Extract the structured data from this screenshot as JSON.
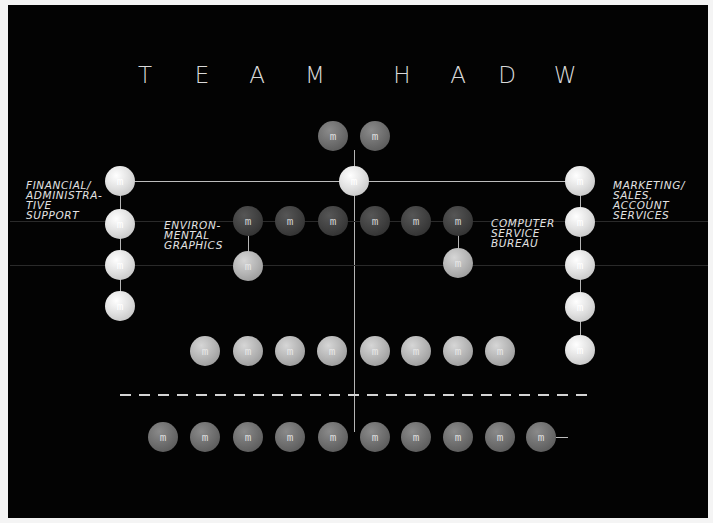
{
  "title": {
    "words": [
      "TEAM",
      "HADW"
    ],
    "letters": [
      {
        "char": "T",
        "x": 145
      },
      {
        "char": "E",
        "x": 202
      },
      {
        "char": "A",
        "x": 257
      },
      {
        "char": "M",
        "x": 315
      },
      {
        "char": "H",
        "x": 402
      },
      {
        "char": "A",
        "x": 458
      },
      {
        "char": "D",
        "x": 507
      },
      {
        "char": "W",
        "x": 565
      }
    ]
  },
  "labels": {
    "financial": [
      "FINANCIAL/",
      "ADMINISTRA-",
      "TIVE",
      "SUPPORT"
    ],
    "marketing": [
      "MARKETING/",
      "SALES,",
      "ACCOUNT",
      "SERVICES"
    ],
    "environmental": [
      "ENVIRON-",
      "MENTAL",
      "GRAPHICS"
    ],
    "computer": [
      "COMPUTER",
      "SERVICE",
      "BUREAU"
    ]
  },
  "candy_mark": "m",
  "colors": {
    "board": "#030303",
    "frame": "#f4f4f4",
    "chalk": "#d9d9d9",
    "candy_light": "#e2e2e2",
    "candy_grey": "#b3b3b3",
    "candy_mid": "#6d6d6d",
    "candy_dark": "#3e3e3e"
  }
}
